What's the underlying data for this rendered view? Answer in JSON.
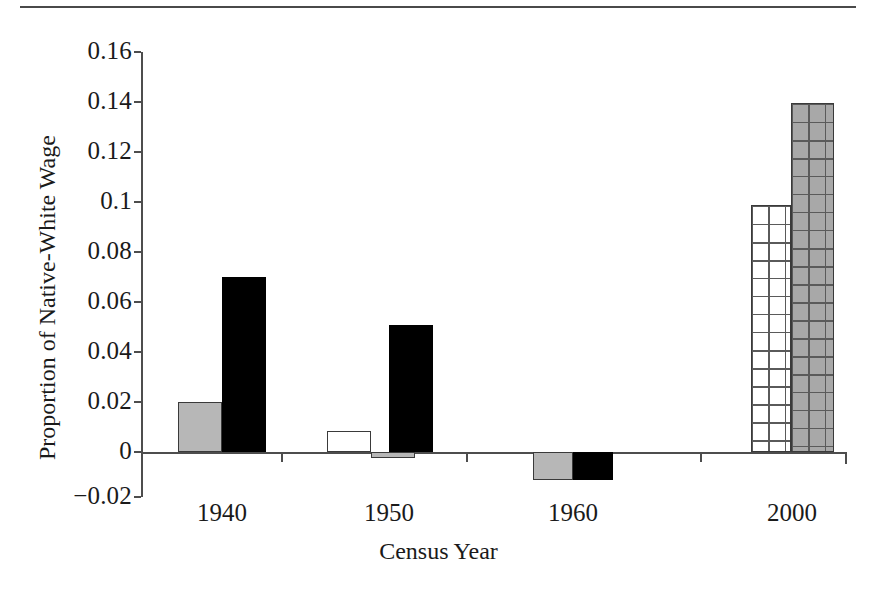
{
  "figure": {
    "has_top_rule": true,
    "background_color": "#ffffff"
  },
  "chart_data": {
    "type": "bar",
    "title": "",
    "subtitle": "",
    "xlabel": "Census Year",
    "ylabel": "Proportion of Native-White Wage",
    "categories": [
      "1940",
      "1950",
      "1960",
      "2000"
    ],
    "x_tick_labels": [
      "1940",
      "1950",
      "1960",
      "2000"
    ],
    "y_tick_labels": [
      "0.16",
      "0.14",
      "0.12",
      "0.1",
      "0.08",
      "0.06",
      "0.04",
      "0.02",
      "0",
      "−0.02"
    ],
    "y_tick_values": [
      0.16,
      0.14,
      0.12,
      0.1,
      0.08,
      0.06,
      0.04,
      0.02,
      0,
      -0.02
    ],
    "ylim": [
      -0.02,
      0.16
    ],
    "y_tick_step": 0.02,
    "grid": false,
    "legend": false,
    "legend_position": "none",
    "zero_line": true,
    "annotations": [],
    "series": [
      {
        "name": "series-1",
        "style": "solid-white",
        "fill_color": "#ffffff",
        "values": [
          null,
          0.0085,
          null,
          0.099
        ]
      },
      {
        "name": "series-2",
        "style": "solid-gray",
        "fill_color": "#b7b7b7",
        "values": [
          0.02,
          -0.0025,
          -0.011,
          0.1397
        ]
      },
      {
        "name": "series-3",
        "style": "solid-black",
        "fill_color": "#000000",
        "values": [
          0.07,
          0.051,
          -0.011,
          null
        ]
      }
    ],
    "bars": [
      {
        "category": "1940",
        "index": 0,
        "value": 0.02,
        "style": "solid-gray",
        "x": 178,
        "width": 44
      },
      {
        "category": "1940",
        "index": 1,
        "value": 0.07,
        "style": "solid-black",
        "x": 222,
        "width": 44
      },
      {
        "category": "1950",
        "index": 0,
        "value": 0.0085,
        "style": "solid-white",
        "x": 327,
        "width": 44
      },
      {
        "category": "1950",
        "index": 1,
        "value": -0.0025,
        "style": "solid-gray",
        "x": 371,
        "width": 44
      },
      {
        "category": "1950",
        "index": 2,
        "value": 0.051,
        "style": "solid-black",
        "x": 389,
        "width": 44
      },
      {
        "category": "1960",
        "index": 0,
        "value": -0.011,
        "style": "solid-gray",
        "x": 533,
        "width": 40
      },
      {
        "category": "1960",
        "index": 1,
        "value": -0.011,
        "style": "solid-black",
        "x": 573,
        "width": 40
      },
      {
        "category": "2000",
        "index": 0,
        "value": 0.099,
        "style": "grid-white",
        "x": 751,
        "width": 40
      },
      {
        "category": "2000",
        "index": 1,
        "value": 0.1397,
        "style": "grid-gray",
        "x": 791,
        "width": 43
      }
    ]
  }
}
